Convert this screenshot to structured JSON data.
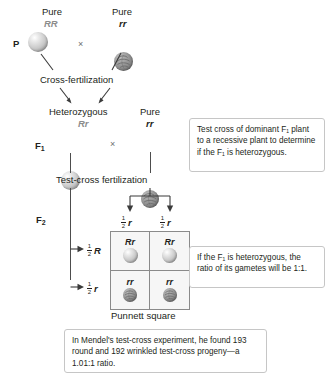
{
  "figure": {
    "generations": {
      "p_label": "P",
      "f1_label": "F",
      "f1_sub": "1",
      "f2_label": "F",
      "f2_sub": "2"
    },
    "p_row": {
      "left_purity": "Pure",
      "left_genotype": "RR",
      "right_purity": "Pure",
      "right_genotype": "rr",
      "cross_symbol": "×",
      "left_seed": "round-seed-icon",
      "right_seed": "wrinkled-seed-icon"
    },
    "cross_fertilization_label": "Cross-fertilization",
    "f1_row": {
      "left_purity": "Heterozygous",
      "left_genotype": "Rr",
      "right_purity": "Pure",
      "right_genotype": "rr",
      "cross_symbol": "×",
      "left_seed": "round-seed-icon",
      "right_seed": "wrinkled-seed-icon"
    },
    "testcross_fertilization_label": "Test-cross fertilization",
    "gametes": {
      "column_left": {
        "fraction_num": "1",
        "fraction_den": "2",
        "allele": "r"
      },
      "column_right": {
        "fraction_num": "1",
        "fraction_den": "2",
        "allele": "r"
      },
      "row_top": {
        "fraction_num": "1",
        "fraction_den": "2",
        "allele": "R"
      },
      "row_bottom": {
        "fraction_num": "1",
        "fraction_den": "2",
        "allele": "r"
      }
    },
    "punnett": {
      "caption": "Punnett square",
      "cells": [
        {
          "genotype": "Rr",
          "seed": "round-seed-icon"
        },
        {
          "genotype": "Rr",
          "seed": "round-seed-icon"
        },
        {
          "genotype": "rr",
          "seed": "wrinkled-seed-icon"
        },
        {
          "genotype": "rr",
          "seed": "wrinkled-seed-icon"
        }
      ]
    },
    "callouts": {
      "top": "Test cross of dominant F₁ plant to a recessive plant to determine if the F₁ is heterozygous.",
      "middle": "If the F₁ is heterozygous, the ratio of its gametes will be 1:1.",
      "bottom": "In Mendel's test-cross experiment, he found 193 round and 192 wrinkled test-cross progeny—a 1.01:1 ratio."
    },
    "colors": {
      "background": "#ffffff",
      "text": "#231f20",
      "dominant_genotype": "#8c8c8c",
      "line": "#3b3b3b",
      "callout_border": "#c6c6c6",
      "punnett_border": "#8a8a8a",
      "punnett_fill": "#f6f6f6"
    }
  }
}
